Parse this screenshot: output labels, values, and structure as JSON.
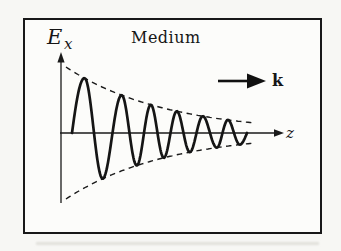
{
  "figure": {
    "background": "#f7f7f4",
    "frame_color": "#181818",
    "ink_color": "#1a1a1a",
    "labels": {
      "field_symbol": "E",
      "field_subscript": "x",
      "medium": "Medium",
      "wave_vector": "k",
      "axis": "z"
    },
    "wave": {
      "type": "damped-sine",
      "axis_y": 133,
      "start_x": 72,
      "end_x": 247,
      "envelope": {
        "style": "dashed-exponential",
        "amplitude0": 66,
        "x0": 66,
        "decay_per_px": 0.01,
        "x_start": 66,
        "x_end": 254
      },
      "phase_points": [
        [
          72,
          0
        ],
        [
          85,
          0.5
        ],
        [
          103,
          1.5
        ],
        [
          122,
          2.5
        ],
        [
          137,
          3.5
        ],
        [
          151,
          4.5
        ],
        [
          164,
          5.5
        ],
        [
          177,
          6.5
        ],
        [
          190,
          7.5
        ],
        [
          203,
          8.5
        ],
        [
          217,
          9.5
        ],
        [
          228,
          10.5
        ],
        [
          240,
          11.5
        ],
        [
          247,
          12
        ]
      ],
      "cycles_shown": 6
    }
  }
}
